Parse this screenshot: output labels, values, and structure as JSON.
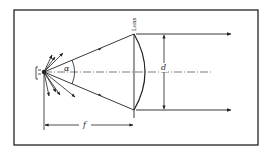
{
  "diagram": {
    "labels": {
      "lens": "Lens",
      "angle": "α",
      "diameter": "d",
      "focal_length": "f"
    },
    "colors": {
      "background": "#ffffff",
      "line": "#222222",
      "frame": "#333333"
    }
  }
}
